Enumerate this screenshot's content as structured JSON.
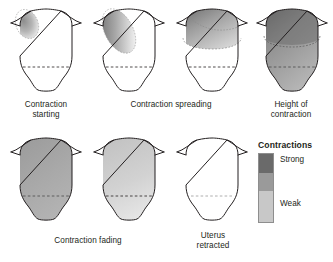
{
  "figure": {
    "background_color": "#ffffff",
    "outline_color": "#231f20",
    "dashed_line_color": "#231f20"
  },
  "shade_colors": {
    "strong": "#6a6a6a",
    "medium": "#9a9a9a",
    "weak": "#c8c8c8",
    "none": "#ffffff"
  },
  "panels": [
    {
      "id": "panel-1",
      "caption": "Contraction\nstarting",
      "intensity": "strong",
      "shaded_region": "upper-left-fundus-small",
      "shaded_fraction": 0.12,
      "dashed_line": true
    },
    {
      "id": "panel-2",
      "caption": "Contraction spreading",
      "intensity": "strong",
      "shaded_region": "upper-left-diagonal-elongated",
      "shaded_fraction": 0.3,
      "dashed_line": true
    },
    {
      "id": "panel-3",
      "caption": "Contraction spreading",
      "intensity": "strong",
      "shaded_region": "entire-fundus-dome",
      "shaded_fraction": 0.45,
      "dashed_line": true
    },
    {
      "id": "panel-4",
      "caption": "Height of\ncontraction",
      "intensity": "strong",
      "shaded_region": "whole-uterus",
      "shaded_fraction": 1.0,
      "dashed_line": true
    },
    {
      "id": "panel-5",
      "caption": "Contraction fading",
      "intensity": "medium",
      "shaded_region": "whole-uterus",
      "shaded_fraction": 1.0,
      "dashed_line": true
    },
    {
      "id": "panel-6",
      "caption": "Contraction fading",
      "intensity": "weak",
      "shaded_region": "whole-uterus",
      "shaded_fraction": 1.0,
      "dashed_line": true
    },
    {
      "id": "panel-7",
      "caption": "Uterus\nretracted",
      "intensity": "none",
      "shaded_region": "none",
      "shaded_fraction": 0.0,
      "dashed_line": true
    }
  ],
  "captions": {
    "c1": "Contraction\nstarting",
    "c2": "Contraction spreading",
    "c3": "Height of\ncontraction",
    "c4": "Contraction fading",
    "c5": "Uterus\nretracted"
  },
  "legend": {
    "title": "Contractions",
    "top_label": "Strong",
    "bottom_label": "Weak",
    "segments": [
      {
        "label": "Strong",
        "color": "#6a6a6a"
      },
      {
        "label": "",
        "color": "#9a9a9a"
      },
      {
        "label": "Weak",
        "color": "#c8c8c8"
      }
    ]
  }
}
